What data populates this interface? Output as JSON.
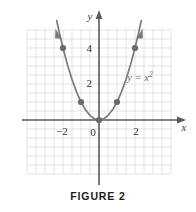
{
  "figure": {
    "caption": "FIGURE 2",
    "curve_label_base": "y = x",
    "curve_label_exponent": "2",
    "x_axis_label": "x",
    "y_axis_label": "y",
    "origin_label": "0",
    "x_tick_labels": [
      "−2",
      "2"
    ],
    "y_tick_labels": [
      "2",
      "4"
    ],
    "colors": {
      "curve": "#7a7a7a",
      "point": "#6b6b6b",
      "axis": "#5a5a5a",
      "grid": "#d8d8d8",
      "text": "#2e2e2e",
      "label": "#6e6e6e",
      "background": "#ffffff"
    }
  },
  "chart_data": {
    "type": "line",
    "title": "FIGURE 2",
    "subtitle": "",
    "xlabel": "x",
    "ylabel": "y",
    "equation": "y = x^2",
    "annotations": [
      "y = x²"
    ],
    "legend": [],
    "legend_position": "none",
    "grid": true,
    "grid_step": 0.5,
    "xlim": [
      -4,
      4
    ],
    "ylim": [
      -2,
      6
    ],
    "x_ticks": [
      -2,
      2
    ],
    "y_ticks": [
      2,
      4
    ],
    "x_tick_labels": [
      "−2",
      "2"
    ],
    "y_tick_labels": [
      "2",
      "4"
    ],
    "origin_label": "0",
    "arrows": {
      "x_axis": "right",
      "y_axis": "up",
      "curve_left_end": "up-left",
      "curve_right_end": "up-right"
    },
    "series": [
      {
        "name": "y = x²",
        "type": "line",
        "color": "#7a7a7a",
        "x": [
          -2.35,
          -2.2,
          -2,
          -1.75,
          -1.5,
          -1.25,
          -1,
          -0.75,
          -0.5,
          -0.25,
          0,
          0.25,
          0.5,
          0.75,
          1,
          1.25,
          1.5,
          1.75,
          2,
          2.2,
          2.35
        ],
        "values": [
          5.5225,
          4.84,
          4,
          3.0625,
          2.25,
          1.5625,
          1,
          0.5625,
          0.25,
          0.0625,
          0,
          0.0625,
          0.25,
          0.5625,
          1,
          1.5625,
          2.25,
          3.0625,
          4,
          4.84,
          5.5225
        ]
      },
      {
        "name": "marked points",
        "type": "scatter",
        "color": "#6b6b6b",
        "points": [
          {
            "x": -2,
            "y": 4
          },
          {
            "x": -1,
            "y": 1
          },
          {
            "x": 0,
            "y": 0
          },
          {
            "x": 1,
            "y": 1
          },
          {
            "x": 2,
            "y": 4
          }
        ]
      }
    ]
  }
}
